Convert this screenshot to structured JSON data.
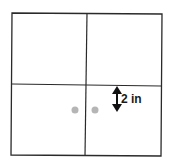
{
  "diagram": {
    "colors": {
      "line": "#2a2a2a",
      "dot": "#b5b5b5",
      "arrow": "#111111"
    },
    "dimension_label": "2 in",
    "dots": [
      {
        "x": 75,
        "y": 110
      },
      {
        "x": 95,
        "y": 110
      }
    ]
  }
}
